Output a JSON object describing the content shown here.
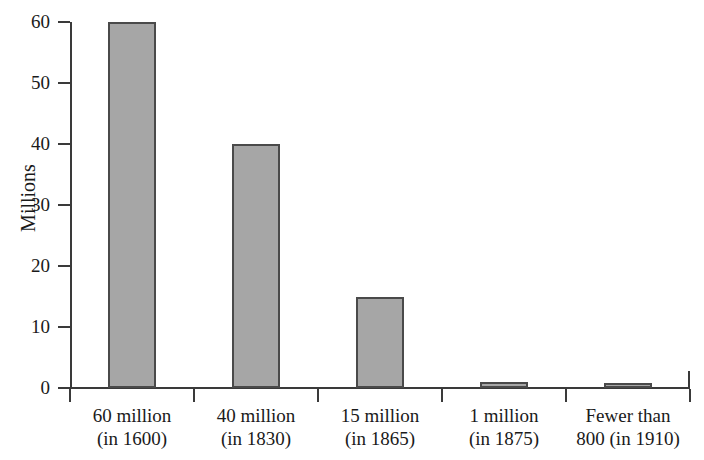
{
  "chart_data": {
    "type": "bar",
    "title": "",
    "subtitle": "",
    "xlabel": "",
    "ylabel": "Millions",
    "ylim": [
      0,
      60
    ],
    "ytick_labels": [
      "60",
      "50",
      "40",
      "30",
      "20",
      "10",
      "0"
    ],
    "ytick_values": [
      60,
      50,
      40,
      30,
      20,
      10,
      0
    ],
    "grid": false,
    "legend": null,
    "categories": [
      "60 million (in 1600)",
      "40 million (in 1830)",
      "15 million (in 1865)",
      "1 million (in 1875)",
      "Fewer than 800 (in 1910)"
    ],
    "category_labels": [
      {
        "line1": "60 million",
        "line2": "(in 1600)"
      },
      {
        "line1": "40 million",
        "line2": "(in 1830)"
      },
      {
        "line1": "15 million",
        "line2": "(in 1865)"
      },
      {
        "line1": "1 million",
        "line2": "(in 1875)"
      },
      {
        "line1": "Fewer than",
        "line2": "800 (in 1910)"
      }
    ],
    "values": [
      60,
      40,
      15,
      1,
      0.8
    ],
    "bar_color": "#a6a6a6",
    "bar_edge_color": "#4a4a4a",
    "axis_color": "#3a3a3a",
    "background": "#ffffff"
  }
}
